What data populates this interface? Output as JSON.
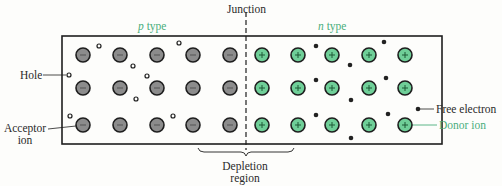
{
  "labels": {
    "p_type_italic": "p",
    "p_type_rest": " type",
    "n_type_italic": "n",
    "n_type_rest": " type",
    "junction": "Junction",
    "hole": "Hole",
    "acceptor_line1": "Acceptor",
    "acceptor_line2": "ion",
    "free_electron": "Free electron",
    "donor_ion": "Donor ion",
    "depletion_line1": "Depletion",
    "depletion_line2": "region"
  },
  "colors": {
    "accent_green": "#4aae7c",
    "acceptor_fill": "#8c8c8c",
    "donor_fill": "#6fcf98",
    "outline": "#1e1e1e"
  },
  "acceptor_ions": [
    [
      83,
      55
    ],
    [
      120,
      55
    ],
    [
      157,
      55
    ],
    [
      193,
      55
    ],
    [
      230,
      55
    ],
    [
      83,
      88
    ],
    [
      120,
      88
    ],
    [
      157,
      88
    ],
    [
      193,
      88
    ],
    [
      230,
      88
    ],
    [
      83,
      125
    ],
    [
      120,
      125
    ],
    [
      157,
      125
    ],
    [
      193,
      125
    ],
    [
      230,
      125
    ]
  ],
  "donor_ions": [
    [
      262,
      55
    ],
    [
      298,
      55
    ],
    [
      332,
      55
    ],
    [
      369,
      55
    ],
    [
      405,
      55
    ],
    [
      262,
      88
    ],
    [
      298,
      88
    ],
    [
      332,
      88
    ],
    [
      369,
      88
    ],
    [
      405,
      88
    ],
    [
      262,
      125
    ],
    [
      298,
      125
    ],
    [
      332,
      125
    ],
    [
      369,
      125
    ],
    [
      405,
      125
    ]
  ],
  "holes": [
    [
      99,
      46
    ],
    [
      179,
      43
    ],
    [
      133,
      66
    ],
    [
      147,
      76
    ],
    [
      69,
      75
    ],
    [
      136,
      99
    ],
    [
      70,
      116
    ],
    [
      173,
      116
    ]
  ],
  "free_electrons": [
    [
      316,
      46
    ],
    [
      384,
      42
    ],
    [
      350,
      65
    ],
    [
      316,
      80
    ],
    [
      386,
      78
    ],
    [
      351,
      100
    ],
    [
      316,
      115
    ],
    [
      388,
      114
    ],
    [
      418,
      109
    ],
    [
      351,
      138
    ]
  ]
}
